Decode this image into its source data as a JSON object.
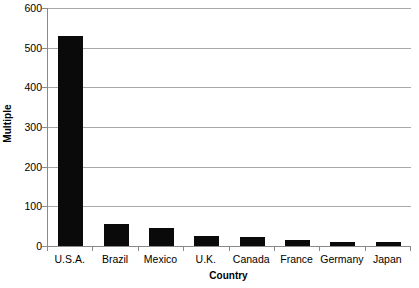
{
  "chart_data": {
    "type": "bar",
    "title": "",
    "xlabel": "Country",
    "ylabel": "Multiple",
    "categories": [
      "U.S.A.",
      "Brazil",
      "Mexico",
      "U.K.",
      "Canada",
      "France",
      "Germany",
      "Japan"
    ],
    "values": [
      530,
      56,
      45,
      25,
      22,
      16,
      11,
      10
    ],
    "ylim": [
      0,
      600
    ],
    "yticks": [
      0,
      100,
      200,
      300,
      400,
      500,
      600
    ],
    "ytick_labels": [
      "0",
      "100",
      "200",
      "300",
      "400",
      "500",
      "600"
    ],
    "grid": true,
    "grid_axis": "y",
    "legend": false,
    "bar_color": "#0a0a0a",
    "grid_color": "#a9a9a9",
    "axis_color": "#8a8a8a",
    "background": "#ffffff"
  }
}
